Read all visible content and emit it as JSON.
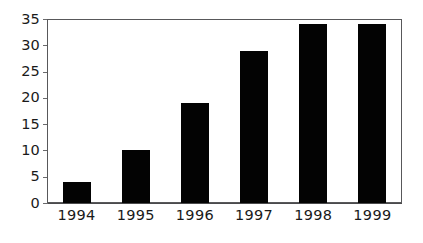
{
  "chart_data": {
    "type": "bar",
    "title": "",
    "subtitle": "",
    "xlabel": "",
    "ylabel": "",
    "categories": [
      "1994",
      "1995",
      "1996",
      "1997",
      "1998",
      "1999"
    ],
    "values": [
      4,
      10,
      19,
      29,
      34,
      34
    ],
    "series": [
      {
        "name": "",
        "values": [
          4,
          10,
          19,
          29,
          34,
          34
        ]
      }
    ],
    "ylim": [
      0,
      35
    ],
    "ytick_values": [
      0,
      5,
      10,
      15,
      20,
      25,
      30,
      35
    ],
    "ytick_labels": [
      "0",
      "5",
      "10",
      "15",
      "20",
      "25",
      "30",
      "35"
    ],
    "xtick_labels": [
      "1994",
      "1995",
      "1996",
      "1997",
      "1998",
      "1999"
    ],
    "grid": "horizontal",
    "legend": "none",
    "annotations": [],
    "colors": {
      "bar": "#030303",
      "gridline": "#6a6a6c",
      "frame": "#58585a",
      "axis": "#4a4a4c",
      "text": "#1a1a1a",
      "background": "#ffffff"
    }
  }
}
